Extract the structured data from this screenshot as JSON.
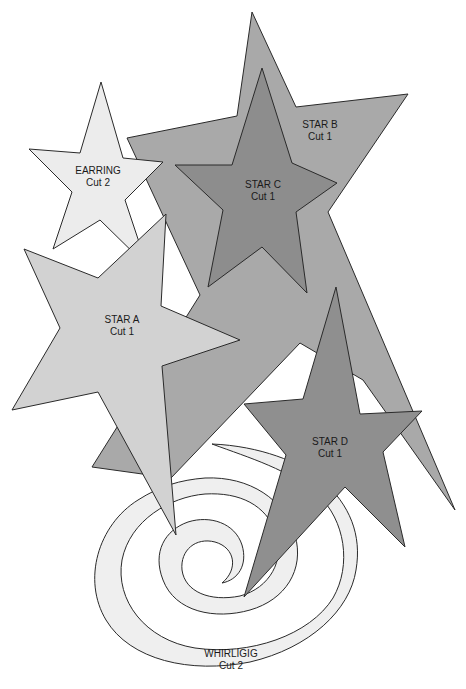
{
  "colors": {
    "background": "#ffffff",
    "outline": "#2a2a2a",
    "earring": "#ececec",
    "star_a": "#d2d2d2",
    "star_b": "#a9a9a9",
    "star_c": "#8d8d8d",
    "star_d": "#8f8f8f",
    "whirligig": "#efefef"
  },
  "pieces": [
    {
      "id": "star_b",
      "name": "STAR B",
      "cut": "Cut 1",
      "label_x": 320,
      "label_y": 120
    },
    {
      "id": "star_c",
      "name": "STAR C",
      "cut": "Cut 1",
      "label_x": 263,
      "label_y": 183
    },
    {
      "id": "earring",
      "name": "EARRING",
      "cut": "Cut 2",
      "label_x": 98,
      "label_y": 170
    },
    {
      "id": "star_a",
      "name": "STAR A",
      "cut": "Cut 1",
      "label_x": 122,
      "label_y": 318
    },
    {
      "id": "star_d",
      "name": "STAR D",
      "cut": "Cut 1",
      "label_x": 330,
      "label_y": 440
    },
    {
      "id": "whirligig",
      "name": "WHIRLIGIG",
      "cut": "Cut 2",
      "label_x": 231,
      "label_y": 652
    }
  ]
}
